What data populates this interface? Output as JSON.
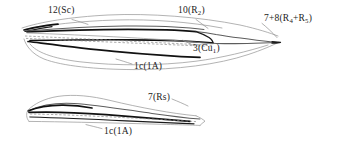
{
  "figure": {
    "background_color": "#ffffff",
    "ink_color": "#111111",
    "parts": [
      {
        "name": "forewing",
        "label": "forewing"
      },
      {
        "name": "hindwing",
        "label": "hindwing"
      }
    ]
  },
  "labels": {
    "sc": {
      "number": "12",
      "vein": "Sc",
      "text": "12(Sc)"
    },
    "r2": {
      "number": "10",
      "vein": "R",
      "subscript": "2",
      "text": "10(R2)"
    },
    "r4r5": {
      "number": "7+8",
      "vein": "R4+R5",
      "text": "7+8(R4+R5)"
    },
    "cu1": {
      "number": "3",
      "vein": "Cu",
      "subscript": "1",
      "text": "3(Cu1)"
    },
    "a1_forewing": {
      "number": "1c",
      "vein": "1A",
      "text": "1c(1A)"
    },
    "rs": {
      "number": "7",
      "vein": "Rs",
      "text": "7(Rs)"
    },
    "a1_hindwing": {
      "number": "1c",
      "vein": "1A",
      "text": "1c(1A)"
    }
  }
}
